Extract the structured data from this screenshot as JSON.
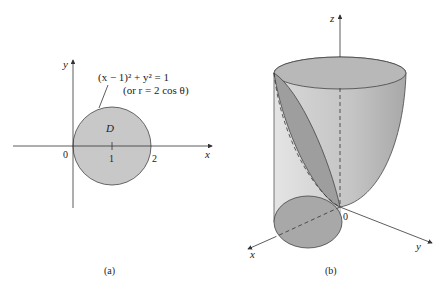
{
  "figure_a": {
    "caption": "(a)",
    "axis_x_label": "x",
    "axis_y_label": "y",
    "region_label": "D",
    "origin_label": "0",
    "tick_1": "1",
    "tick_2": "2",
    "equation_line1": "(x − 1)² + y² = 1",
    "equation_line2": "(or r = 2 cos θ)"
  },
  "figure_b": {
    "caption": "(b)",
    "axis_x_label": "x",
    "axis_y_label": "y",
    "axis_z_label": "z",
    "origin_label": "0"
  },
  "colors": {
    "region_fill": "#c8c8c8",
    "surface_light": "#dcdcdc",
    "surface_mid": "#bdbdbd",
    "surface_dark": "#9a9a9a",
    "line": "#333333"
  }
}
